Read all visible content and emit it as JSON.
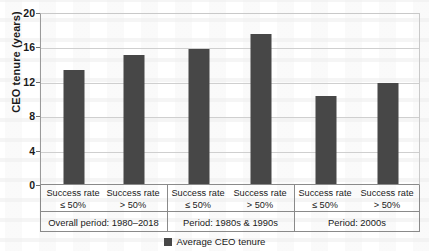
{
  "chart_data": {
    "type": "bar",
    "title": "",
    "xlabel": "",
    "ylabel": "CEO tenure (years)",
    "ylim": [
      0,
      20
    ],
    "yticks": [
      0,
      4,
      8,
      12,
      16,
      20
    ],
    "grid": true,
    "legend_position": "bottom",
    "legend": [
      "Average CEO tenure"
    ],
    "categories": [
      "Success rate\n≤ 50%",
      "Success rate\n> 50%",
      "Success rate\n≤ 50%",
      "Success rate\n> 50%",
      "Success rate\n≤ 50%",
      "Success rate\n> 50%"
    ],
    "values": [
      13.3,
      15.0,
      15.7,
      17.4,
      10.2,
      11.7
    ],
    "series": [
      {
        "name": "Average CEO tenure",
        "color": "#474747",
        "values": [
          13.3,
          15.0,
          15.7,
          17.4,
          10.2,
          11.7
        ]
      }
    ],
    "groups": [
      {
        "label": "Overall period: 1980–2018",
        "bar_indices": [
          0,
          1
        ]
      },
      {
        "label": "Period: 1980s & 1990s",
        "bar_indices": [
          2,
          3
        ]
      },
      {
        "label": "Period: 2000s",
        "bar_indices": [
          4,
          5
        ]
      }
    ]
  },
  "axis": {
    "y_title": "CEO tenure (years)",
    "tick_0": "0",
    "tick_4": "4",
    "tick_8": "8",
    "tick_12": "12",
    "tick_16": "16",
    "tick_20": "20"
  },
  "categories": {
    "c0_line1": "Success rate",
    "c0_line2": "≤ 50%",
    "c1_line1": "Success rate",
    "c1_line2": "> 50%",
    "c2_line1": "Success rate",
    "c2_line2": "≤ 50%",
    "c3_line1": "Success rate",
    "c3_line2": "> 50%",
    "c4_line1": "Success rate",
    "c4_line2": "≤ 50%",
    "c5_line1": "Success rate",
    "c5_line2": "> 50%"
  },
  "groups": {
    "g0": "Overall period: 1980–2018",
    "g1": "Period: 1980s & 1990s",
    "g2": "Period: 2000s"
  },
  "legend": {
    "item_0": "Average CEO tenure"
  },
  "colors": {
    "bar": "#474747",
    "grid": "#cfcfcf",
    "axis": "#8a8a8a"
  }
}
